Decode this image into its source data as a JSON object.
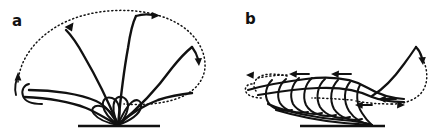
{
  "figure": {
    "background_color": "#ffffff",
    "ink_color": "#111111",
    "width": 439,
    "height": 137,
    "panels": [
      {
        "id": "a",
        "label": "a",
        "label_x": 18,
        "label_y": 24,
        "description": "Fan of solid trajectory curves emanating from a single ground point, enclosed by a large dotted return arc",
        "ground_line": {
          "x1": 78,
          "y1": 126,
          "x2": 160,
          "y2": 126
        },
        "origin": {
          "x": 118,
          "y": 125
        },
        "curve_count": 6,
        "arrow_count": 4,
        "dotted_arc_label": "outer dotted return arc"
      },
      {
        "id": "b",
        "label": "b",
        "label_x": 250,
        "label_y": 22,
        "description": "Nested leftward-rolling loops above a ground line with a tall right-hand solid crest and dotted return path",
        "ground_line": {
          "x1": 300,
          "y1": 126,
          "x2": 385,
          "y2": 126
        },
        "origin": {
          "x": 372,
          "y": 125
        },
        "loop_count": 7,
        "arrow_count": 7,
        "dotted_arc_label": "dotted return paths left and right"
      }
    ],
    "legend_notes": {
      "solid": "solid line = material trajectory",
      "dotted": "dotted line = return / entrainment path",
      "arrow": "arrow = direction of motion"
    }
  }
}
